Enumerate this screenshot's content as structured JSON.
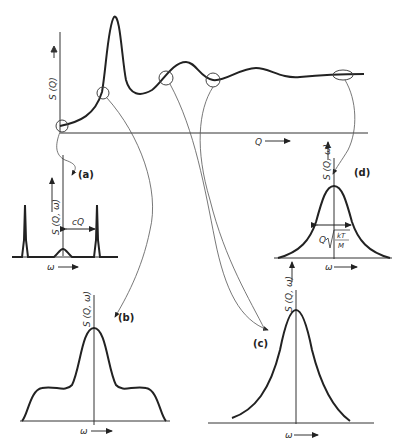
{
  "main_plot": {
    "y_label": "S (Q)",
    "x_label": "Q",
    "description": "Static structure factor S(Q) vs Q with main peak and damped oscillations"
  },
  "insets": [
    {
      "id": "a",
      "tag": "(a)",
      "y_label": "S (Q, ω)",
      "x_label": "ω",
      "annotation": "cQ",
      "shape": "Brillouin doublet with weak central line"
    },
    {
      "id": "b",
      "tag": "(b)",
      "y_label": "S (Q, ω)",
      "x_label": "ω",
      "shape": "central peak with side shoulders"
    },
    {
      "id": "c",
      "tag": "(c)",
      "y_label": "S (Q, ω)",
      "x_label": "ω",
      "shape": "single narrowed central peak (de Gennes narrowing)"
    },
    {
      "id": "d",
      "tag": "(d)",
      "y_label": "S (Q, ω)",
      "x_label": "ω",
      "annotation_prefix": "Q",
      "annotation_num": "kT",
      "annotation_den": "M",
      "shape": "Gaussian free-particle limit"
    }
  ],
  "colors": {
    "line": "#2a2a2a",
    "thin": "#555555",
    "background": "#ffffff"
  }
}
